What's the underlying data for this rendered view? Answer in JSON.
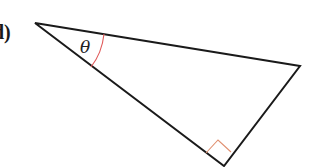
{
  "problem_label": "d)",
  "angle_label": "θ",
  "colors": {
    "stroke": "#1a1a1a",
    "angle_mark": "#e05a5a",
    "right_angle_mark": "#e09070"
  },
  "triangle": {
    "vertices": {
      "apex": [
        35,
        23
      ],
      "right": [
        300,
        66
      ],
      "bottom": [
        224,
        166
      ]
    },
    "right_angle_at": "bottom",
    "marked_angle_at": "apex"
  }
}
